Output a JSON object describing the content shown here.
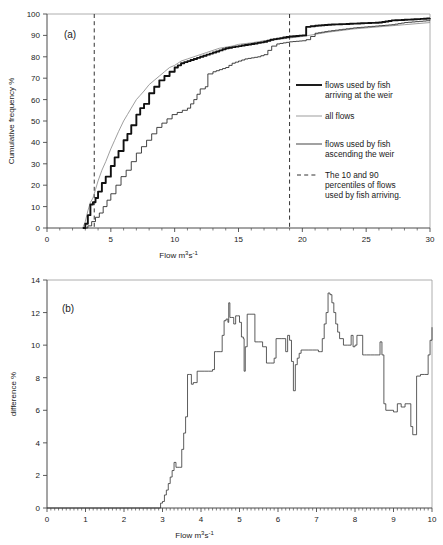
{
  "figure": {
    "panels": [
      "(a)",
      "(b)"
    ]
  },
  "panel_a": {
    "label": "(a)",
    "ylabel": "Cumulative frequency %",
    "xlabel_main": "Flow m",
    "xlabel_sup1": "3",
    "xlabel_mid": "s",
    "xlabel_sup2": "-1",
    "xticks": [
      0,
      5,
      10,
      15,
      20,
      25,
      30
    ],
    "yticks": [
      0,
      10,
      20,
      30,
      40,
      50,
      60,
      70,
      80,
      90,
      100
    ],
    "legend": [
      {
        "label_line1": "flows used by fish",
        "label_line2": "arriving at the weir",
        "style": "thick-solid"
      },
      {
        "label_line1": "all flows",
        "label_line2": "",
        "style": "thin-grey-solid"
      },
      {
        "label_line1": "flows used by fish",
        "label_line2": "ascending the weir",
        "style": "thin-black-solid"
      },
      {
        "label_line1": "The 10 and 90",
        "label_line2": "percentiles of flows",
        "label_line3": "used by fish arriving.",
        "style": "dashed"
      }
    ]
  },
  "panel_b": {
    "label": "(b)",
    "ylabel": "difference %",
    "xlabel_main": "Flow m",
    "xlabel_sup1": "3",
    "xlabel_mid": "s",
    "xlabel_sup2": "-1",
    "xticks": [
      0,
      1,
      2,
      3,
      4,
      5,
      6,
      7,
      8,
      9,
      10
    ],
    "yticks": [
      0,
      2,
      4,
      6,
      8,
      10,
      12,
      14
    ]
  },
  "colors": {
    "thick_curve": "#111111",
    "thin_grey_curve": "#8c8c8c",
    "thin_black_curve": "#222222",
    "axis": "#4a4a4a",
    "dashed": "#333333",
    "background": "#ffffff"
  },
  "chart_data": [
    {
      "type": "line",
      "title": "(a)",
      "xlabel": "Flow m3 s-1",
      "ylabel": "Cumulative frequency %",
      "xlim": [
        0,
        30
      ],
      "ylim": [
        0,
        100
      ],
      "grid": false,
      "legend_position": "right-inside",
      "annotations": [
        {
          "type": "vline",
          "x": 3.7,
          "label": "10th percentile of flows used by fish arriving"
        },
        {
          "type": "vline",
          "x": 19.0,
          "label": "90th percentile of flows used by fish arriving"
        }
      ],
      "series": [
        {
          "name": "flows used by fish arriving at the weir",
          "style": "thick-solid",
          "x": [
            2.8,
            3.0,
            3.2,
            3.4,
            3.6,
            3.8,
            4.0,
            4.3,
            4.6,
            5.0,
            5.3,
            5.6,
            6.0,
            6.3,
            6.6,
            7.0,
            7.3,
            7.6,
            8.0,
            8.4,
            8.8,
            9.2,
            9.6,
            10.0,
            10.5,
            11.0,
            11.5,
            12.0,
            12.5,
            13.0,
            13.5,
            14.0,
            14.5,
            15.0,
            15.5,
            16.0,
            16.5,
            17.0,
            17.5,
            18.0,
            19.0,
            20.0,
            20.3,
            21.0,
            22.0,
            24.0,
            26.0,
            27.0,
            28.0,
            29.0,
            30.0
          ],
          "y": [
            0,
            2,
            6,
            11,
            12,
            14,
            17,
            21,
            24,
            29,
            33,
            36,
            41,
            44,
            48,
            53,
            56,
            58,
            63,
            66,
            69,
            71,
            73,
            75,
            77,
            78,
            79,
            80,
            81,
            82,
            83,
            84,
            84.5,
            85,
            85.5,
            86,
            86.5,
            87,
            88,
            88.5,
            89.5,
            90,
            94,
            94.5,
            95,
            95.5,
            96,
            97,
            97.3,
            97.6,
            98
          ]
        },
        {
          "name": "all flows",
          "style": "thin-grey-solid",
          "x": [
            2.8,
            3.0,
            3.2,
            3.4,
            3.6,
            3.8,
            4.0,
            4.3,
            4.6,
            5.0,
            5.3,
            5.6,
            6.0,
            6.3,
            6.6,
            7.0,
            7.3,
            7.6,
            8.0,
            8.4,
            8.8,
            9.2,
            9.6,
            10.0,
            10.5,
            11.0,
            11.5,
            12.0,
            12.5,
            13.0,
            13.5,
            14.0,
            14.5,
            15.0,
            16.0,
            17.0,
            18.0,
            19.0,
            20.0,
            21.0,
            22.0,
            24.0,
            26.0,
            28.0,
            30.0
          ],
          "y": [
            0,
            3,
            8,
            12,
            14,
            18,
            22,
            27,
            31,
            37,
            41,
            45,
            50,
            53,
            56,
            60,
            62,
            64,
            67,
            69,
            71,
            73,
            75,
            76,
            78,
            79,
            80,
            81,
            82,
            83,
            84,
            84.5,
            85,
            85.8,
            86.5,
            87.5,
            88,
            88.8,
            89.5,
            90.5,
            91.5,
            93,
            94,
            95,
            96
          ]
        },
        {
          "name": "flows used by fish ascending the weir",
          "style": "thin-black-solid",
          "x": [
            2.9,
            3.2,
            3.5,
            3.8,
            4.1,
            4.4,
            4.7,
            5.0,
            5.4,
            5.8,
            6.2,
            6.6,
            7.0,
            7.4,
            7.8,
            8.2,
            8.6,
            9.0,
            9.4,
            9.8,
            10.2,
            10.6,
            11.0,
            11.5,
            12.0,
            12.4,
            12.6,
            13.0,
            13.5,
            14.0,
            14.5,
            15.0,
            15.5,
            16.0,
            16.5,
            17.0,
            17.6,
            18.0,
            19.0,
            20.0,
            20.3,
            21.0,
            22.0,
            24.0,
            26.0,
            27.0,
            28.0,
            30.0
          ],
          "y": [
            0,
            1,
            3,
            5,
            7,
            10,
            13,
            16,
            20,
            24,
            27,
            31,
            35,
            38,
            41,
            44,
            47,
            49,
            51,
            53,
            54,
            55,
            56,
            60,
            65,
            66,
            72,
            73,
            74,
            75,
            77,
            78,
            79,
            79.5,
            80,
            81,
            85,
            86,
            87,
            87.5,
            88,
            91,
            92,
            93.5,
            94.5,
            95,
            96,
            97
          ]
        }
      ]
    },
    {
      "type": "line",
      "title": "(b)",
      "xlabel": "Flow m3 s-1",
      "ylabel": "difference %",
      "xlim": [
        0,
        10
      ],
      "ylim": [
        0,
        14
      ],
      "grid": false,
      "legend_position": "none",
      "series": [
        {
          "name": "difference between cumulative frequency curves",
          "style": "thin-black-step",
          "x": [
            0,
            2.9,
            2.95,
            3.0,
            3.05,
            3.1,
            3.15,
            3.2,
            3.25,
            3.3,
            3.35,
            3.4,
            3.45,
            3.5,
            3.55,
            3.6,
            3.65,
            3.7,
            3.75,
            3.8,
            3.9,
            4.0,
            4.1,
            4.2,
            4.3,
            4.35,
            4.4,
            4.5,
            4.55,
            4.6,
            4.65,
            4.7,
            4.72,
            4.75,
            4.8,
            4.85,
            4.9,
            4.95,
            5.0,
            5.05,
            5.1,
            5.12,
            5.15,
            5.2,
            5.25,
            5.3,
            5.35,
            5.4,
            5.5,
            5.6,
            5.7,
            5.8,
            5.9,
            5.95,
            6.0,
            6.1,
            6.2,
            6.25,
            6.3,
            6.35,
            6.4,
            6.45,
            6.5,
            6.55,
            6.6,
            6.65,
            6.7,
            6.8,
            6.9,
            7.0,
            7.05,
            7.1,
            7.15,
            7.2,
            7.25,
            7.3,
            7.35,
            7.4,
            7.45,
            7.5,
            7.55,
            7.6,
            7.7,
            7.8,
            7.9,
            7.95,
            8.0,
            8.05,
            8.1,
            8.2,
            8.25,
            8.3,
            8.4,
            8.5,
            8.6,
            8.65,
            8.7,
            8.75,
            8.8,
            9.0,
            9.05,
            9.1,
            9.2,
            9.3,
            9.35,
            9.4,
            9.45,
            9.5,
            9.6,
            9.7,
            9.8,
            9.9,
            9.95,
            10.0
          ],
          "y": [
            0,
            0,
            0.3,
            0.4,
            0.8,
            1.1,
            1.5,
            1.9,
            2.3,
            2.8,
            2.5,
            2.5,
            2.5,
            3.6,
            4.6,
            5.6,
            8.2,
            8.2,
            7.6,
            7.7,
            8.4,
            8.4,
            8.4,
            8.4,
            8.5,
            9.6,
            9.6,
            9.6,
            10.6,
            11.5,
            11.6,
            11.4,
            12.6,
            11.7,
            11.7,
            11.3,
            11.8,
            11.8,
            11.4,
            10.5,
            10.4,
            8.4,
            9.9,
            11.9,
            11.9,
            11.9,
            11.9,
            10.2,
            10.2,
            9.9,
            8.9,
            8.9,
            9.2,
            10.4,
            10.4,
            10.4,
            9.6,
            10.6,
            10.3,
            9.0,
            7.2,
            8.8,
            9.2,
            9.5,
            9.7,
            9.7,
            9.7,
            9.7,
            9.7,
            9.7,
            9.6,
            9.6,
            10.4,
            11.3,
            12.0,
            13.2,
            13.1,
            12.6,
            12.0,
            11.3,
            10.8,
            10.4,
            10.0,
            10.0,
            10.6,
            9.9,
            10.0,
            10.6,
            10.6,
            9.4,
            9.4,
            9.4,
            9.4,
            9.4,
            9.4,
            10.2,
            9.4,
            6.4,
            6.0,
            5.9,
            5.9,
            6.4,
            6.2,
            6.4,
            6.4,
            6.4,
            5.0,
            4.5,
            8.1,
            8.2,
            8.2,
            9.4,
            10.3,
            11.1
          ]
        }
      ]
    }
  ]
}
